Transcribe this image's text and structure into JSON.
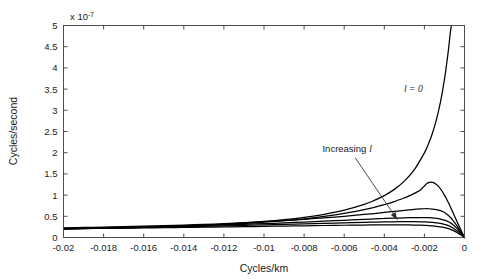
{
  "chart_data": {
    "type": "line",
    "title": "",
    "xlabel": "Cycles/km",
    "ylabel": "Cycles/second",
    "y_exponent_prefix": "x 10",
    "y_exponent_power": "-7",
    "xlim": [
      -0.02,
      0
    ],
    "ylim": [
      0,
      5
    ],
    "grid": false,
    "legend_position": "none",
    "xticks": [
      -0.02,
      -0.018,
      -0.016,
      -0.014,
      -0.012,
      -0.01,
      -0.008,
      -0.006,
      -0.004,
      -0.002,
      0
    ],
    "xtick_labels": [
      "-0.02",
      "-0.018",
      "-0.016",
      "-0.014",
      "-0.012",
      "-0.01",
      "-0.008",
      "-0.006",
      "-0.004",
      "-0.002",
      "0"
    ],
    "yticks": [
      0,
      0.5,
      1,
      1.5,
      2,
      2.5,
      3,
      3.5,
      4,
      4.5,
      5
    ],
    "ytick_labels": [
      "0",
      "0.5",
      "1",
      "1.5",
      "2",
      "2.5",
      "3",
      "3.5",
      "4",
      "4.5",
      "5"
    ],
    "annotations": [
      {
        "name": "l-zero-label",
        "text_plain": "l",
        "text_math": "l = 0",
        "x": -0.00255,
        "y": 3.42
      },
      {
        "name": "increasing-l-label",
        "text": "Increasing",
        "symbol": "l",
        "x": -0.00585,
        "y": 2.02
      }
    ],
    "arrow": {
      "x_start": -0.00545,
      "y_start": 1.88,
      "x_end": -0.00335,
      "y_end": 0.42
    },
    "series": [
      {
        "name": "l = 0",
        "label": "l = 0",
        "points": [
          [
            -0.02,
            0.205
          ],
          [
            -0.019,
            0.213
          ],
          [
            -0.018,
            0.222
          ],
          [
            -0.017,
            0.232
          ],
          [
            -0.016,
            0.244
          ],
          [
            -0.015,
            0.258
          ],
          [
            -0.014,
            0.274
          ],
          [
            -0.013,
            0.293
          ],
          [
            -0.012,
            0.316
          ],
          [
            -0.011,
            0.344
          ],
          [
            -0.01,
            0.378
          ],
          [
            -0.009,
            0.421
          ],
          [
            -0.008,
            0.476
          ],
          [
            -0.007,
            0.548
          ],
          [
            -0.006,
            0.645
          ],
          [
            -0.005,
            0.782
          ],
          [
            -0.0045,
            0.874
          ],
          [
            -0.004,
            0.988
          ],
          [
            -0.0035,
            1.135
          ],
          [
            -0.003,
            1.33
          ],
          [
            -0.0025,
            1.6
          ],
          [
            -0.002,
            1.995
          ],
          [
            -0.0018,
            2.205
          ],
          [
            -0.0016,
            2.46
          ],
          [
            -0.0014,
            2.78
          ],
          [
            -0.0012,
            3.19
          ],
          [
            -0.001,
            3.73
          ],
          [
            -0.0009,
            4.06
          ],
          [
            -0.0008,
            4.43
          ],
          [
            -0.0007,
            4.86
          ],
          [
            -0.00065,
            5.0
          ]
        ]
      },
      {
        "name": "curve-2",
        "label": "",
        "points": [
          [
            -0.02,
            0.2
          ],
          [
            -0.019,
            0.208
          ],
          [
            -0.018,
            0.217
          ],
          [
            -0.017,
            0.227
          ],
          [
            -0.016,
            0.238
          ],
          [
            -0.015,
            0.251
          ],
          [
            -0.014,
            0.266
          ],
          [
            -0.013,
            0.284
          ],
          [
            -0.012,
            0.305
          ],
          [
            -0.011,
            0.33
          ],
          [
            -0.01,
            0.36
          ],
          [
            -0.009,
            0.397
          ],
          [
            -0.008,
            0.442
          ],
          [
            -0.007,
            0.498
          ],
          [
            -0.006,
            0.568
          ],
          [
            -0.005,
            0.658
          ],
          [
            -0.0045,
            0.712
          ],
          [
            -0.004,
            0.775
          ],
          [
            -0.0035,
            0.848
          ],
          [
            -0.003,
            0.935
          ],
          [
            -0.0028,
            0.975
          ],
          [
            -0.0026,
            1.018
          ],
          [
            -0.0024,
            1.065
          ],
          [
            -0.0022,
            1.122
          ],
          [
            -0.002,
            1.215
          ],
          [
            -0.0019,
            1.265
          ],
          [
            -0.0018,
            1.295
          ],
          [
            -0.0017,
            1.305
          ],
          [
            -0.0016,
            1.3
          ],
          [
            -0.0015,
            1.282
          ],
          [
            -0.0014,
            1.25
          ],
          [
            -0.0013,
            1.205
          ],
          [
            -0.0012,
            1.148
          ],
          [
            -0.0011,
            1.08
          ],
          [
            -0.001,
            1.0
          ],
          [
            -0.0009,
            0.912
          ],
          [
            -0.0008,
            0.818
          ],
          [
            -0.0007,
            0.718
          ],
          [
            -0.0006,
            0.614
          ],
          [
            -0.0005,
            0.508
          ],
          [
            -0.0004,
            0.404
          ],
          [
            -0.0003,
            0.3
          ],
          [
            -0.0002,
            0.198
          ],
          [
            -0.0001,
            0.098
          ],
          [
            0,
            0
          ]
        ]
      },
      {
        "name": "curve-3",
        "label": "",
        "points": [
          [
            -0.02,
            0.228
          ],
          [
            -0.019,
            0.236
          ],
          [
            -0.018,
            0.245
          ],
          [
            -0.017,
            0.255
          ],
          [
            -0.016,
            0.266
          ],
          [
            -0.015,
            0.279
          ],
          [
            -0.014,
            0.293
          ],
          [
            -0.013,
            0.309
          ],
          [
            -0.012,
            0.327
          ],
          [
            -0.011,
            0.348
          ],
          [
            -0.01,
            0.372
          ],
          [
            -0.009,
            0.399
          ],
          [
            -0.008,
            0.429
          ],
          [
            -0.007,
            0.463
          ],
          [
            -0.006,
            0.5
          ],
          [
            -0.005,
            0.543
          ],
          [
            -0.0045,
            0.565
          ],
          [
            -0.004,
            0.59
          ],
          [
            -0.0035,
            0.615
          ],
          [
            -0.003,
            0.64
          ],
          [
            -0.0028,
            0.65
          ],
          [
            -0.0026,
            0.66
          ],
          [
            -0.0024,
            0.668
          ],
          [
            -0.0022,
            0.674
          ],
          [
            -0.002,
            0.678
          ],
          [
            -0.0018,
            0.678
          ],
          [
            -0.0016,
            0.672
          ],
          [
            -0.0014,
            0.658
          ],
          [
            -0.0012,
            0.632
          ],
          [
            -0.0011,
            0.612
          ],
          [
            -0.001,
            0.588
          ],
          [
            -0.0009,
            0.556
          ],
          [
            -0.0008,
            0.518
          ],
          [
            -0.0007,
            0.472
          ],
          [
            -0.0006,
            0.418
          ],
          [
            -0.0005,
            0.357
          ],
          [
            -0.0004,
            0.292
          ],
          [
            -0.0003,
            0.222
          ],
          [
            -0.0002,
            0.149
          ],
          [
            -0.0001,
            0.075
          ],
          [
            0,
            0
          ]
        ]
      },
      {
        "name": "curve-4",
        "label": "",
        "points": [
          [
            -0.02,
            0.218
          ],
          [
            -0.019,
            0.225
          ],
          [
            -0.018,
            0.233
          ],
          [
            -0.017,
            0.241
          ],
          [
            -0.016,
            0.25
          ],
          [
            -0.015,
            0.26
          ],
          [
            -0.014,
            0.271
          ],
          [
            -0.013,
            0.283
          ],
          [
            -0.012,
            0.296
          ],
          [
            -0.011,
            0.311
          ],
          [
            -0.01,
            0.327
          ],
          [
            -0.009,
            0.345
          ],
          [
            -0.008,
            0.364
          ],
          [
            -0.007,
            0.384
          ],
          [
            -0.006,
            0.406
          ],
          [
            -0.005,
            0.428
          ],
          [
            -0.0045,
            0.438
          ],
          [
            -0.004,
            0.448
          ],
          [
            -0.0035,
            0.457
          ],
          [
            -0.003,
            0.464
          ],
          [
            -0.0026,
            0.468
          ],
          [
            -0.0022,
            0.47
          ],
          [
            -0.002,
            0.47
          ],
          [
            -0.0018,
            0.467
          ],
          [
            -0.0016,
            0.461
          ],
          [
            -0.0014,
            0.45
          ],
          [
            -0.0012,
            0.434
          ],
          [
            -0.001,
            0.41
          ],
          [
            -0.0009,
            0.393
          ],
          [
            -0.0008,
            0.372
          ],
          [
            -0.0007,
            0.345
          ],
          [
            -0.0006,
            0.312
          ],
          [
            -0.0005,
            0.272
          ],
          [
            -0.0004,
            0.227
          ],
          [
            -0.0003,
            0.176
          ],
          [
            -0.0002,
            0.12
          ],
          [
            -0.0001,
            0.061
          ],
          [
            0,
            0
          ]
        ]
      },
      {
        "name": "curve-5",
        "label": "",
        "points": [
          [
            -0.02,
            0.212
          ],
          [
            -0.019,
            0.218
          ],
          [
            -0.018,
            0.224
          ],
          [
            -0.017,
            0.231
          ],
          [
            -0.016,
            0.238
          ],
          [
            -0.015,
            0.246
          ],
          [
            -0.014,
            0.254
          ],
          [
            -0.013,
            0.263
          ],
          [
            -0.012,
            0.273
          ],
          [
            -0.011,
            0.284
          ],
          [
            -0.01,
            0.295
          ],
          [
            -0.009,
            0.307
          ],
          [
            -0.008,
            0.32
          ],
          [
            -0.007,
            0.333
          ],
          [
            -0.006,
            0.346
          ],
          [
            -0.005,
            0.358
          ],
          [
            -0.0045,
            0.363
          ],
          [
            -0.004,
            0.368
          ],
          [
            -0.0035,
            0.371
          ],
          [
            -0.003,
            0.373
          ],
          [
            -0.0026,
            0.373
          ],
          [
            -0.0022,
            0.371
          ],
          [
            -0.002,
            0.368
          ],
          [
            -0.0018,
            0.364
          ],
          [
            -0.0016,
            0.357
          ],
          [
            -0.0014,
            0.346
          ],
          [
            -0.0012,
            0.331
          ],
          [
            -0.001,
            0.31
          ],
          [
            -0.0009,
            0.296
          ],
          [
            -0.0008,
            0.279
          ],
          [
            -0.0007,
            0.257
          ],
          [
            -0.0006,
            0.231
          ],
          [
            -0.0005,
            0.201
          ],
          [
            -0.0004,
            0.167
          ],
          [
            -0.0003,
            0.129
          ],
          [
            -0.0002,
            0.088
          ],
          [
            -0.0001,
            0.045
          ],
          [
            0,
            0
          ]
        ]
      },
      {
        "name": "curve-6",
        "label": "",
        "points": [
          [
            -0.02,
            0.206
          ],
          [
            -0.019,
            0.21
          ],
          [
            -0.018,
            0.215
          ],
          [
            -0.017,
            0.22
          ],
          [
            -0.016,
            0.225
          ],
          [
            -0.015,
            0.23
          ],
          [
            -0.014,
            0.236
          ],
          [
            -0.013,
            0.242
          ],
          [
            -0.012,
            0.248
          ],
          [
            -0.011,
            0.255
          ],
          [
            -0.01,
            0.262
          ],
          [
            -0.009,
            0.269
          ],
          [
            -0.008,
            0.276
          ],
          [
            -0.007,
            0.283
          ],
          [
            -0.006,
            0.289
          ],
          [
            -0.005,
            0.294
          ],
          [
            -0.0045,
            0.296
          ],
          [
            -0.004,
            0.297
          ],
          [
            -0.0035,
            0.297
          ],
          [
            -0.003,
            0.296
          ],
          [
            -0.0026,
            0.294
          ],
          [
            -0.0022,
            0.29
          ],
          [
            -0.002,
            0.287
          ],
          [
            -0.0018,
            0.282
          ],
          [
            -0.0016,
            0.275
          ],
          [
            -0.0014,
            0.265
          ],
          [
            -0.0012,
            0.251
          ],
          [
            -0.001,
            0.234
          ],
          [
            -0.0009,
            0.223
          ],
          [
            -0.0008,
            0.21
          ],
          [
            -0.0007,
            0.193
          ],
          [
            -0.0006,
            0.173
          ],
          [
            -0.0005,
            0.15
          ],
          [
            -0.0004,
            0.124
          ],
          [
            -0.0003,
            0.096
          ],
          [
            -0.0002,
            0.065
          ],
          [
            -0.0001,
            0.033
          ],
          [
            0,
            0
          ]
        ]
      }
    ]
  }
}
